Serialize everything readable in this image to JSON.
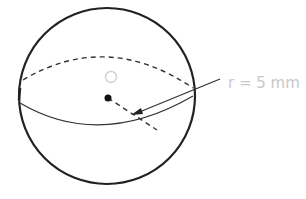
{
  "diagram": {
    "center_label": "O",
    "radius_label": "r = 5 mm",
    "colors": {
      "outline": "#222222",
      "label": "#c8c8c8"
    }
  }
}
